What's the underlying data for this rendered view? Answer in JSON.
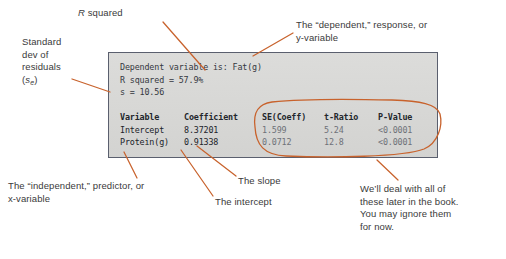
{
  "figure": {
    "accent_color": "#c8622c",
    "box_background": "#d8d8d6",
    "box_border": "#5a5f6e"
  },
  "output_box": {
    "summary": {
      "dependent_line": "Dependent variable is: Fat(g)",
      "r_squared_line": "R squared = 57.9%",
      "s_line": "s = 10.56"
    },
    "table": {
      "headers": {
        "variable": "Variable",
        "coefficient": "Coefficient",
        "se_coeff": "SE(Coeff)",
        "t_ratio": "t-Ratio",
        "p_value": "P-Value"
      },
      "rows": [
        {
          "variable": "Intercept",
          "coefficient": "8.37201",
          "se_coeff": "1.599",
          "t_ratio": "5.24",
          "p_value": "<0.0001"
        },
        {
          "variable": "Protein(g)",
          "coefficient": "0.91338",
          "se_coeff": "0.0712",
          "t_ratio": "12.8",
          "p_value": "<0.0001"
        }
      ]
    }
  },
  "annotations": {
    "standard_dev": "Standard\ndev of\nresiduals\n(s_e)",
    "standard_dev_line1": "Standard",
    "standard_dev_line2": "dev of",
    "standard_dev_line3": "residuals",
    "standard_dev_symbol": "s",
    "standard_dev_subscript": "e",
    "r_squared": "R squared",
    "r_squared_italic": "R",
    "r_squared_rest": " squared",
    "dependent": "The “dependent,” response, or\ny-variable",
    "independent": "The “independent,” predictor, or\nx-variable",
    "slope": "The slope",
    "intercept": "The intercept",
    "note": "We’ll deal with all of\nthese later in the book.\nYou may ignore them\nfor now."
  }
}
